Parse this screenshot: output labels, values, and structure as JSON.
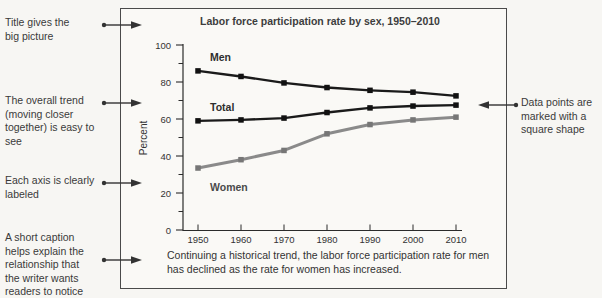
{
  "annotations": {
    "left": [
      {
        "text": "Title gives the big picture"
      },
      {
        "text": "The overall trend (moving closer together) is easy to see"
      },
      {
        "text": "Each axis is clearly labeled"
      },
      {
        "text": "A short caption helps explain the relationship that the writer wants readers to notice"
      }
    ],
    "right": [
      {
        "text": "Data points are marked with a square shape"
      }
    ]
  },
  "chart_data": {
    "type": "line",
    "title": "Labor force participation rate by sex, 1950–2010",
    "ylabel": "Percent",
    "xlabel": "",
    "ylim": [
      0,
      100
    ],
    "y_major_ticks": [
      0,
      20,
      40,
      60,
      80,
      100
    ],
    "y_minor_ticks": [
      10,
      30,
      50,
      70,
      90
    ],
    "x": [
      1950,
      1960,
      1970,
      1980,
      1990,
      2000,
      2010
    ],
    "series": [
      {
        "name": "Men",
        "values": [
          86,
          83,
          79.5,
          77,
          75.5,
          74.5,
          72.5
        ],
        "color": "#1a1a1a",
        "marker_color": "#111111",
        "width": 2.4
      },
      {
        "name": "Total",
        "values": [
          59,
          59.5,
          60.5,
          63.5,
          66,
          67,
          67.5
        ],
        "color": "#1a1a1a",
        "marker_color": "#111111",
        "width": 2.4
      },
      {
        "name": "Women",
        "values": [
          33.5,
          38,
          43,
          52,
          57,
          59.5,
          61
        ],
        "color": "#8a8a8a",
        "marker_color": "#767676",
        "width": 3
      }
    ],
    "marker": "square",
    "legend_position": "inline-labels",
    "grid": false,
    "caption": "Continuing a historical trend, the labor force participation rate for men has declined as the rate for women has increased."
  },
  "arrow_color": "#333333"
}
